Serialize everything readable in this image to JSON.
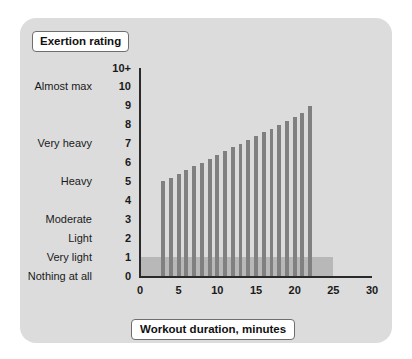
{
  "card": {
    "background_color": "#dcdcdc",
    "page_background_color": "#ffffff"
  },
  "y_axis_title": "Exertion rating",
  "x_axis_title": "Workout duration, minutes",
  "chart_data": {
    "type": "bar",
    "title": "",
    "xlabel": "Workout duration, minutes",
    "ylabel": "Exertion rating",
    "xlim": [
      0,
      30
    ],
    "ylim": [
      0,
      11
    ],
    "grid": false,
    "legend_position": "none",
    "bar_color": "#808080",
    "band_color": "#b8b8b8",
    "shaded_band": {
      "label": "warm-up / cool-down band",
      "x_start": 0,
      "x_end": 25,
      "y_start": 0,
      "y_end": 1
    },
    "x_ticks": [
      0,
      5,
      10,
      15,
      20,
      25,
      30
    ],
    "x_tick_labels": [
      "0",
      "5",
      "10",
      "15",
      "20",
      "25",
      "30"
    ],
    "y_ticks": [
      0,
      1,
      2,
      3,
      4,
      5,
      6,
      7,
      8,
      9,
      10,
      11
    ],
    "y_tick_labels": [
      "0",
      "1",
      "2",
      "3",
      "4",
      "5",
      "6",
      "7",
      "8",
      "9",
      "10",
      "10+"
    ],
    "y_tick_descriptions": [
      "Nothing at all",
      "Very light",
      "Light",
      "Moderate",
      "",
      "Heavy",
      "",
      "Very heavy",
      "",
      "",
      "Almost max",
      ""
    ],
    "x": [
      3.0,
      4.0,
      5.0,
      6.0,
      7.0,
      8.0,
      9.0,
      10.0,
      11.0,
      12.0,
      13.0,
      14.0,
      15.0,
      16.0,
      17.0,
      18.0,
      19.0,
      20.0,
      21.0,
      22.0
    ],
    "values": [
      5.0,
      5.2,
      5.4,
      5.6,
      5.8,
      6.0,
      6.2,
      6.4,
      6.6,
      6.8,
      7.0,
      7.2,
      7.4,
      7.6,
      7.8,
      8.0,
      8.2,
      8.4,
      8.6,
      9.0
    ],
    "bar_width_minutes": 0.5
  }
}
